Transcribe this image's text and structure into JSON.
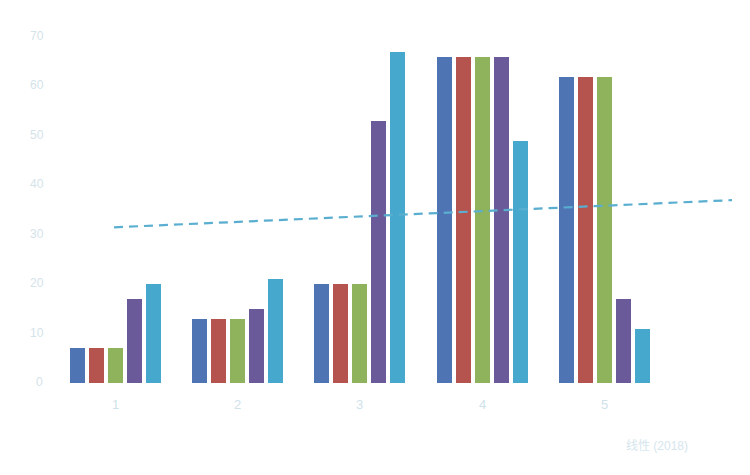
{
  "chart_data": {
    "type": "bar",
    "title": "",
    "xlabel": "",
    "ylabel": "",
    "categories": [
      "1",
      "2",
      "3",
      "4",
      "5"
    ],
    "series": [
      {
        "name": "Series 1",
        "color": "#4f74b4",
        "values": [
          7,
          13,
          20,
          66,
          62
        ]
      },
      {
        "name": "Series 2",
        "color": "#b5534e",
        "values": [
          7,
          13,
          20,
          66,
          62
        ]
      },
      {
        "name": "Series 3",
        "color": "#8fb35c",
        "values": [
          7,
          13,
          20,
          66,
          62
        ]
      },
      {
        "name": "Series 4",
        "color": "#6a5a99",
        "values": [
          17,
          15,
          53,
          66,
          17
        ]
      },
      {
        "name": "Series 5",
        "color": "#45a8cc",
        "values": [
          20,
          21,
          67,
          49,
          11
        ]
      }
    ],
    "trendline": {
      "type": "linear",
      "style": "dashed",
      "color": "#5aaed0",
      "start": 31.5,
      "end": 37
    },
    "yticks": [
      0,
      10,
      20,
      30,
      40,
      50,
      60,
      70
    ],
    "ylim": [
      0,
      70
    ],
    "grid": false,
    "legend": "none",
    "annotation": "线性 (2018)"
  },
  "source_label": "线性 (2018)"
}
